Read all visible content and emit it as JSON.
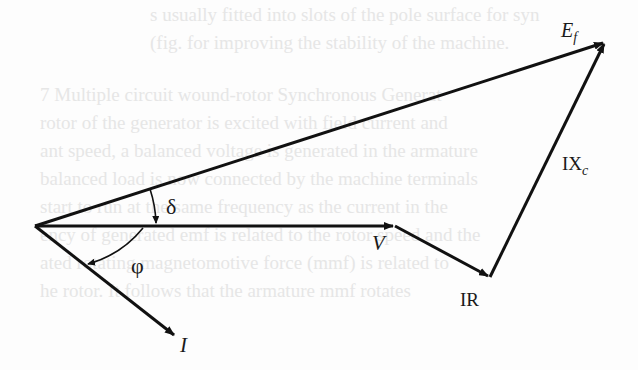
{
  "diagram": {
    "type": "phasor-diagram",
    "vectors": [
      {
        "name": "V",
        "label": "V",
        "from": [
          35,
          226
        ],
        "to": [
          395,
          226
        ]
      },
      {
        "name": "IR",
        "label": "IR",
        "from": [
          395,
          226
        ],
        "to": [
          490,
          277
        ]
      },
      {
        "name": "IXc",
        "label": "IX",
        "subscript": "c",
        "from": [
          490,
          277
        ],
        "to": [
          605,
          42
        ]
      },
      {
        "name": "Ef",
        "label": "E",
        "subscript": "f",
        "from": [
          35,
          226
        ],
        "to": [
          605,
          42
        ]
      },
      {
        "name": "I",
        "label": "I",
        "from": [
          35,
          226
        ],
        "to": [
          176,
          337
        ]
      }
    ],
    "angles": [
      {
        "name": "delta",
        "symbol": "δ",
        "between": [
          "Ef",
          "V"
        ]
      },
      {
        "name": "phi",
        "symbol": "φ",
        "between": [
          "V",
          "I"
        ]
      }
    ]
  },
  "labels": {
    "Ef_main": "E",
    "Ef_sub": "f",
    "IXc_main": "IX",
    "IXc_sub": "c",
    "V": "V",
    "IR": "IR",
    "I": "I",
    "delta": "δ",
    "phi": "φ"
  },
  "background_bleed_text": [
    "s usually fitted into slots of the pole surface for syn",
    "(fig. for improving the stability of the machine.",
    "",
    "7   Multiple circuit wound-rotor Synchronous Generat",
    "rotor of the generator is excited with field current and",
    "ant speed, a balanced voltage is generated in the armature",
    "balanced load is now connected by the machine terminals",
    "start to run at the same frequency as the current in the",
    "ency of generated emf is related to the rotor speed and the",
    "ated rotating magnetomotive force (mmf) is related to",
    "he rotor. It follows that the armature mmf rotates"
  ]
}
